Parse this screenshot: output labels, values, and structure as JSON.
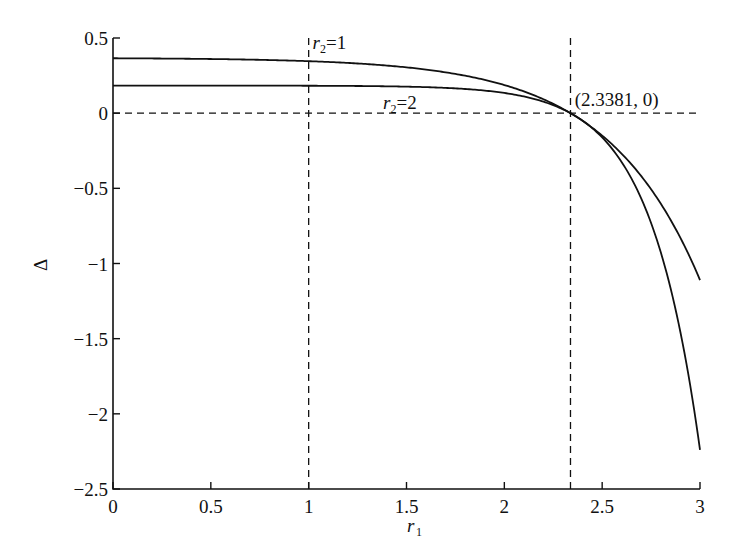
{
  "chart_data": {
    "type": "line",
    "title": "",
    "xlabel": "r1",
    "xlabel_main": "r",
    "xlabel_sub": "1",
    "ylabel": "Δ",
    "xlim": [
      0,
      3
    ],
    "ylim": [
      -2.5,
      0.5
    ],
    "grid": false,
    "x_ticks": [
      0,
      0.5,
      1,
      1.5,
      2,
      2.5,
      3
    ],
    "x_tick_labels": [
      "0",
      "0.5",
      "1",
      "1.5",
      "2",
      "2.5",
      "3"
    ],
    "y_ticks": [
      0.5,
      0,
      -0.5,
      -1,
      -1.5,
      -2,
      -2.5
    ],
    "y_tick_labels": [
      "0.5",
      "0",
      "−0.5",
      "−1",
      "−1.5",
      "−2",
      "−2.5"
    ],
    "x": [
      0,
      0.25,
      0.5,
      0.75,
      1.0,
      1.25,
      1.5,
      1.75,
      2.0,
      2.1,
      2.2,
      2.3381,
      2.45,
      2.55,
      2.65,
      2.75,
      2.85,
      2.93,
      3.0
    ],
    "series": [
      {
        "name": "r2=1",
        "values": [
          0.37,
          0.37,
          0.37,
          0.36,
          0.35,
          0.33,
          0.3,
          0.24,
          0.13,
          0.07,
          0.03,
          0.0,
          -0.1,
          -0.24,
          -0.4,
          -0.57,
          -0.77,
          -0.94,
          -1.11
        ]
      },
      {
        "name": "r2=2",
        "values": [
          0.18,
          0.18,
          0.18,
          0.18,
          0.18,
          0.18,
          0.17,
          0.16,
          0.13,
          0.1,
          0.07,
          0.0,
          -0.13,
          -0.34,
          -0.6,
          -0.95,
          -1.42,
          -1.86,
          -2.24
        ]
      }
    ],
    "reference_lines": [
      {
        "orientation": "horizontal",
        "y": 0,
        "style": "dashed"
      },
      {
        "orientation": "vertical",
        "x": 1,
        "style": "dashed"
      },
      {
        "orientation": "vertical",
        "x": 2.3381,
        "style": "dashed"
      }
    ],
    "annotations": [
      {
        "text": "r2=1",
        "main": "r",
        "sub": "2",
        "rest": "=1",
        "x": 1.02,
        "y": 0.43
      },
      {
        "text": "r2=2",
        "main": "r",
        "sub": "2",
        "rest": "=2",
        "x": 1.38,
        "y": 0.03
      },
      {
        "text": "(2.3381, 0)",
        "x": 2.36,
        "y": 0.05
      }
    ]
  }
}
